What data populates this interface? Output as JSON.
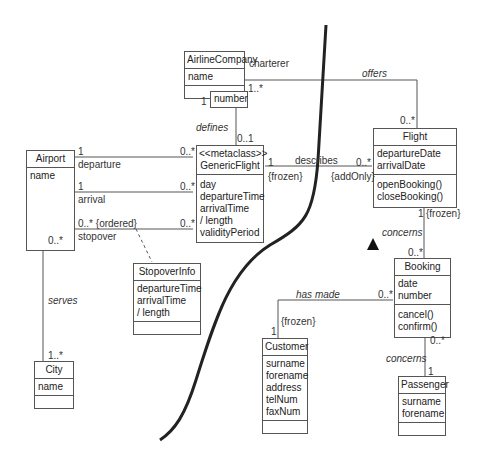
{
  "classes": {
    "airline_company": {
      "name": "AirlineCompany",
      "attributes": [
        "name"
      ],
      "operations": []
    },
    "generic_flight": {
      "stereotype": "<<metaclass>>",
      "name": "GenericFlight",
      "attributes": [
        "day",
        "departureTime",
        "arrivalTime",
        "/ length",
        "validityPeriod"
      ],
      "operations": []
    },
    "airport": {
      "name": "Airport",
      "attributes": [
        "name"
      ],
      "operations": []
    },
    "flight": {
      "name": "Flight",
      "attributes": [
        "departureDate",
        "arrivalDate"
      ],
      "operations": [
        "openBooking()",
        "closeBooking()"
      ]
    },
    "stopover_info": {
      "name": "StopoverInfo",
      "attributes": [
        "departureTime",
        "arrivalTime",
        "/ length"
      ],
      "operations": []
    },
    "city": {
      "name": "City",
      "attributes": [
        "name"
      ],
      "operations": []
    },
    "booking": {
      "name": "Booking",
      "attributes": [
        "date",
        "number"
      ],
      "operations": [
        "cancel()",
        "confirm()"
      ]
    },
    "customer": {
      "name": "Customer",
      "attributes": [
        "surname",
        "forename",
        "address",
        "telNum",
        "faxNum"
      ],
      "operations": []
    },
    "passenger": {
      "name": "Passenger",
      "attributes": [
        "surname",
        "forename"
      ],
      "operations": []
    }
  },
  "qualifier": {
    "name": "number"
  },
  "labels": {
    "charterer": "charterer",
    "offers": "offers",
    "airline_mult": "1..*",
    "flight_offers_mult": "0..*",
    "qual_one": "1",
    "defines": "defines",
    "defines_mult": "0..1",
    "departure": "departure",
    "dep_one": "1",
    "dep_many": "0..*",
    "arrival": "arrival",
    "arr_one": "1",
    "arr_many": "0..*",
    "stopover": "stopover",
    "stop_ordered": "0..* {ordered}",
    "stop_many": "0..*",
    "airport_serves_mult": "0..*",
    "serves": "serves",
    "city_mult": "1..*",
    "describes": "describes",
    "describes_one": "1",
    "describes_frozen": "{frozen}",
    "describes_many": "0..*",
    "add_only": "{addOnly}",
    "flight_one": "1",
    "flight_frozen": "{frozen}",
    "concerns_1": "concerns",
    "booking_many": "0..*",
    "has_made": "has made",
    "has_made_many": "0..*",
    "customer_frozen": "{frozen}",
    "customer_one": "1",
    "booking_pass_many": "0..*",
    "concerns_2": "concerns",
    "passenger_one": "1"
  }
}
